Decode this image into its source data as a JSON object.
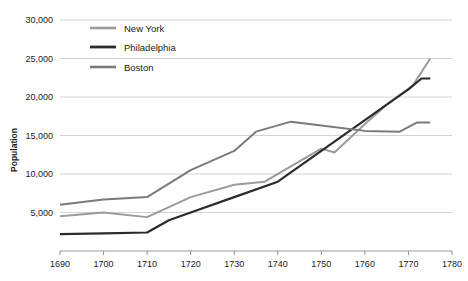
{
  "chart_data": {
    "type": "line",
    "title": "",
    "xlabel": "",
    "ylabel": "Population",
    "xlim": [
      1690,
      1780
    ],
    "ylim": [
      0,
      30000
    ],
    "grid": true,
    "legend_position": "top-left-inside",
    "xticks": [
      "1690",
      "1700",
      "1710",
      "1720",
      "1730",
      "1740",
      "1750",
      "1760",
      "1770",
      "1780"
    ],
    "xtick_values": [
      1690,
      1700,
      1710,
      1720,
      1730,
      1740,
      1750,
      1760,
      1770,
      1780
    ],
    "yticks": [
      "5,000",
      "10,000",
      "15,000",
      "20,000",
      "25,000",
      "30,000"
    ],
    "ytick_values": [
      5000,
      10000,
      15000,
      20000,
      25000,
      30000
    ],
    "series": [
      {
        "name": "New York",
        "color": "#9b9b9b",
        "width": 2.0,
        "x": [
          1690,
          1700,
          1710,
          1720,
          1730,
          1737,
          1743,
          1750,
          1753,
          1760,
          1765,
          1771,
          1775
        ],
        "values": [
          4500,
          5000,
          4400,
          7000,
          8600,
          9000,
          11000,
          13300,
          12800,
          16500,
          19000,
          21500,
          25000
        ]
      },
      {
        "name": "Philadelphia",
        "color": "#2b2b2b",
        "width": 2.2,
        "x": [
          1690,
          1700,
          1710,
          1715,
          1720,
          1730,
          1740,
          1750,
          1760,
          1765,
          1770,
          1773,
          1775
        ],
        "values": [
          2200,
          2300,
          2400,
          4000,
          5000,
          7000,
          9000,
          13000,
          17000,
          19000,
          21000,
          22400,
          22400
        ]
      },
      {
        "name": "Boston",
        "color": "#7a7a7a",
        "width": 2.0,
        "x": [
          1690,
          1700,
          1710,
          1720,
          1730,
          1735,
          1743,
          1750,
          1760,
          1768,
          1772,
          1775
        ],
        "values": [
          6000,
          6700,
          7000,
          10500,
          13000,
          15500,
          16800,
          16300,
          15600,
          15500,
          16700,
          16700
        ]
      }
    ]
  },
  "legend": {
    "items": [
      {
        "label": "New York"
      },
      {
        "label": "Philadelphia"
      },
      {
        "label": "Boston"
      }
    ]
  }
}
